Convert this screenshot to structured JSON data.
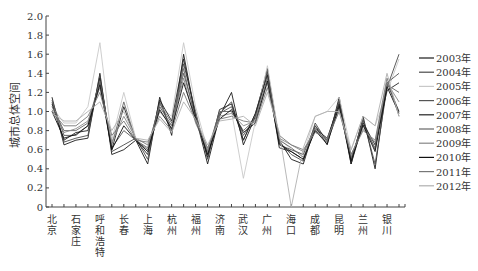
{
  "chart_data": {
    "type": "line",
    "title": "",
    "xlabel": "",
    "ylabel": "城市总体空间",
    "ylim": [
      0,
      2.0
    ],
    "yticks": [
      "0",
      "0.2",
      "0.4",
      "0.6",
      "0.8",
      "1.0",
      "1.2",
      "1.4",
      "1.6",
      "1.8",
      "2.0"
    ],
    "grid": false,
    "legend_position": "right",
    "x_labels": [
      "北京",
      "石家庄",
      "呼和浩特",
      "长春",
      "上海",
      "杭州",
      "福州",
      "济南",
      "武汉",
      "广州",
      "海口",
      "成都",
      "昆明",
      "兰州",
      "银川"
    ],
    "n_points": 30,
    "series": [
      {
        "name": "2003年",
        "color": "#1a1a1a",
        "values": [
          1.15,
          0.65,
          0.7,
          0.72,
          1.4,
          0.55,
          0.6,
          0.7,
          0.45,
          1.15,
          0.75,
          1.6,
          0.95,
          0.45,
          0.95,
          1.2,
          0.65,
          0.95,
          1.45,
          0.7,
          0.5,
          0.45,
          0.85,
          0.65,
          1.15,
          0.45,
          0.95,
          0.4,
          1.3,
          1.0
        ]
      },
      {
        "name": "2004年",
        "color": "#4a4a4a",
        "values": [
          1.1,
          0.68,
          0.72,
          0.75,
          1.38,
          0.58,
          0.65,
          0.72,
          0.5,
          1.1,
          0.8,
          1.5,
          1.0,
          0.5,
          0.98,
          1.1,
          0.7,
          0.98,
          1.42,
          0.68,
          0.55,
          0.48,
          0.88,
          0.68,
          1.12,
          0.48,
          0.92,
          0.45,
          1.25,
          1.6
        ]
      },
      {
        "name": "2005年",
        "color": "#c8c8c8",
        "values": [
          1.05,
          0.88,
          0.88,
          1.05,
          1.72,
          0.7,
          1.2,
          0.72,
          0.65,
          1.05,
          0.95,
          1.72,
          1.05,
          0.6,
          1.0,
          1.0,
          0.3,
          0.9,
          1.48,
          0.72,
          0.6,
          0.55,
          0.95,
          1.0,
          1.15,
          0.6,
          0.95,
          0.85,
          1.2,
          1.55
        ]
      },
      {
        "name": "2006年",
        "color": "#555555",
        "values": [
          1.12,
          0.75,
          0.75,
          0.85,
          1.3,
          0.62,
          0.8,
          0.7,
          0.6,
          1.05,
          0.85,
          1.4,
          0.95,
          0.55,
          0.98,
          1.05,
          0.75,
          0.95,
          1.4,
          0.65,
          0.6,
          0.55,
          0.85,
          0.7,
          1.1,
          0.5,
          0.9,
          0.6,
          1.3,
          1.4
        ]
      },
      {
        "name": "2007年",
        "color": "#222222",
        "values": [
          1.08,
          0.7,
          0.78,
          0.8,
          1.35,
          0.6,
          1.05,
          0.7,
          0.55,
          1.12,
          0.9,
          1.55,
          0.95,
          0.52,
          1.02,
          1.08,
          0.7,
          0.98,
          1.38,
          0.62,
          0.58,
          0.5,
          0.82,
          0.72,
          1.08,
          0.45,
          0.88,
          0.65,
          1.22,
          1.3
        ]
      },
      {
        "name": "2008年",
        "color": "#666666",
        "values": [
          1.05,
          0.8,
          0.8,
          0.88,
          1.32,
          0.65,
          1.1,
          0.7,
          0.62,
          1.08,
          0.88,
          1.45,
          0.9,
          0.58,
          1.0,
          1.0,
          0.8,
          0.92,
          1.35,
          0.7,
          0.62,
          0.52,
          0.8,
          0.7,
          1.05,
          0.52,
          0.85,
          0.62,
          1.28,
          1.2
        ]
      },
      {
        "name": "2009年",
        "color": "#888888",
        "values": [
          1.02,
          0.78,
          0.82,
          0.9,
          1.25,
          0.68,
          0.95,
          0.72,
          0.65,
          1.0,
          0.85,
          1.35,
          0.88,
          0.6,
          0.95,
          0.98,
          0.85,
          0.9,
          1.3,
          0.72,
          0.65,
          0.58,
          0.82,
          0.68,
          1.02,
          0.55,
          0.82,
          0.68,
          1.3,
          1.1
        ]
      },
      {
        "name": "2010年",
        "color": "#111111",
        "values": [
          1.0,
          0.72,
          0.76,
          0.85,
          1.28,
          0.6,
          0.85,
          0.7,
          0.58,
          1.02,
          0.82,
          1.3,
          0.92,
          0.55,
          0.92,
          1.02,
          0.78,
          0.88,
          1.32,
          0.66,
          0.58,
          0.5,
          0.8,
          0.66,
          1.06,
          0.48,
          0.86,
          0.58,
          1.26,
          0.98
        ]
      },
      {
        "name": "2011年",
        "color": "#777777",
        "values": [
          1.0,
          0.85,
          0.85,
          0.95,
          1.2,
          0.75,
          0.9,
          0.7,
          0.68,
          0.95,
          0.8,
          1.2,
          0.9,
          0.62,
          0.92,
          0.95,
          0.9,
          0.88,
          1.25,
          0.75,
          0.65,
          0.6,
          0.78,
          0.72,
          1.0,
          0.55,
          0.8,
          0.7,
          1.35,
          0.95
        ]
      },
      {
        "name": "2012年",
        "color": "#b0b0b0",
        "values": [
          0.98,
          0.9,
          0.9,
          1.0,
          1.1,
          0.8,
          1.0,
          0.72,
          0.7,
          0.92,
          0.78,
          1.1,
          0.92,
          0.65,
          0.9,
          0.92,
          0.95,
          0.85,
          1.2,
          0.78,
          0.0,
          0.62,
          0.95,
          1.0,
          1.0,
          0.6,
          0.95,
          0.85,
          1.4,
          0.95
        ]
      }
    ]
  }
}
